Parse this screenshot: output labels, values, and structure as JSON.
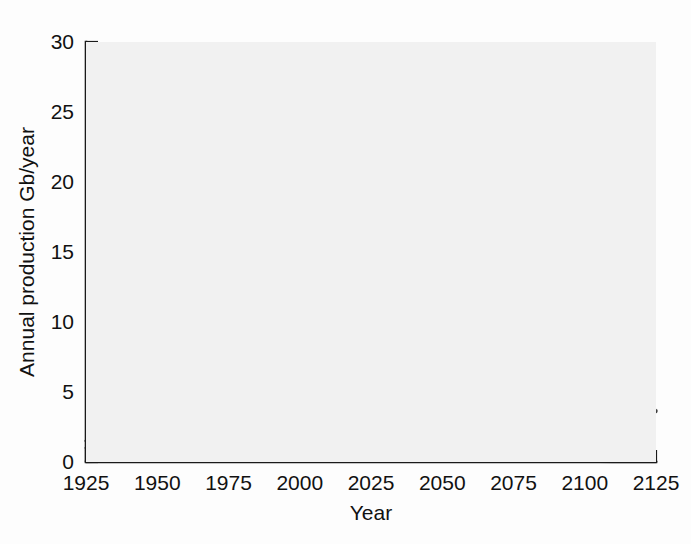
{
  "chart_data": {
    "type": "line",
    "title": "",
    "xlabel": "Year",
    "ylabel": "Annual production Gb/year",
    "xlim": [
      1925,
      2125
    ],
    "ylim": [
      0,
      30
    ],
    "xticks": [
      1925,
      1950,
      1975,
      2000,
      2025,
      2050,
      2075,
      2100,
      2125
    ],
    "yticks": [
      0,
      5,
      10,
      15,
      20,
      25,
      30
    ],
    "grid": false,
    "legend_position": "top-right",
    "units": "Gb/year",
    "x": [
      1925,
      1930,
      1935,
      1940,
      1945,
      1950,
      1955,
      1960,
      1965,
      1970,
      1973,
      1975,
      1979,
      1981,
      1983,
      1985,
      1990,
      1995,
      2000,
      2005,
      2007,
      2010,
      2015,
      2020,
      2025,
      2030,
      2035,
      2040,
      2045,
      2050,
      2055,
      2060,
      2065,
      2070,
      2075,
      2080,
      2085,
      2090,
      2095,
      2100,
      2105,
      2110,
      2115,
      2120,
      2125
    ],
    "series": [
      {
        "name": "Past production",
        "label": "Past production",
        "color": "#3c3c3c",
        "width": 3.1,
        "values": [
          1.5,
          1.9,
          2.2,
          2.8,
          3.2,
          4.0,
          5.2,
          7.2,
          10.2,
          16.8,
          20.3,
          21.6,
          22.8,
          21.0,
          20.2,
          20.4,
          22.3,
          23.6,
          25.6,
          28.2,
          28.7,
          28.4,
          26.6,
          23.1,
          19.0,
          15.3,
          12.5,
          10.4,
          8.9,
          7.8,
          7.0,
          6.4,
          6.0,
          5.7,
          5.5,
          5.3,
          5.1,
          4.9,
          4.7,
          4.5,
          4.3,
          4.1,
          3.9,
          3.75,
          3.6
        ]
      },
      {
        "name": "Conventional",
        "label": "Conventional",
        "color": "#c9c9c9",
        "width": 2.9,
        "values": [
          0.9,
          1.1,
          1.4,
          1.8,
          2.3,
          3.0,
          4.0,
          5.4,
          7.4,
          10.0,
          11.4,
          12.4,
          14.4,
          15.4,
          16.3,
          17.2,
          19.3,
          20.9,
          22.3,
          23.4,
          23.5,
          23.3,
          22.2,
          20.1,
          17.3,
          14.2,
          11.2,
          8.6,
          6.4,
          4.7,
          3.4,
          2.4,
          1.7,
          1.2,
          0.85,
          0.6,
          0.42,
          0.3,
          0.22,
          0.16,
          0.12,
          0.09,
          0.07,
          0.05,
          0.04
        ]
      },
      {
        "name": "Nonconventional",
        "label": "Nonconventional",
        "color": "#b4b4b4",
        "width": 2.9,
        "values": [
          0.02,
          0.03,
          0.04,
          0.05,
          0.07,
          0.1,
          0.14,
          0.2,
          0.28,
          0.4,
          0.46,
          0.52,
          0.65,
          0.72,
          0.8,
          0.88,
          1.1,
          1.35,
          1.65,
          2.0,
          2.15,
          2.35,
          2.8,
          3.25,
          3.7,
          4.1,
          4.5,
          4.85,
          5.1,
          5.35,
          5.5,
          5.65,
          5.75,
          5.82,
          5.87,
          5.9,
          5.88,
          5.8,
          5.65,
          5.45,
          5.15,
          4.8,
          4.4,
          4.0,
          3.65
        ]
      },
      {
        "name": "Gas liquids",
        "label": "Gas liquids",
        "color": "#9a9a9a",
        "width": 2.9,
        "values": [
          0.05,
          0.07,
          0.1,
          0.14,
          0.2,
          0.28,
          0.4,
          0.55,
          0.75,
          1.0,
          1.12,
          1.2,
          1.4,
          1.5,
          1.6,
          1.7,
          1.95,
          2.2,
          2.5,
          2.85,
          3.0,
          3.2,
          3.6,
          3.85,
          3.9,
          3.7,
          3.3,
          2.8,
          2.3,
          1.8,
          1.35,
          1.0,
          0.72,
          0.5,
          0.35,
          0.24,
          0.16,
          0.11,
          0.07,
          0.05,
          0.03,
          0.02,
          0.015,
          0.01,
          0.01
        ]
      },
      {
        "name": "Conventional and nonconventional",
        "label": "Conventional and nonconventional",
        "color": "#5a5a5a",
        "width": 3.1,
        "values": [
          1.0,
          1.25,
          1.55,
          1.95,
          2.45,
          3.1,
          4.1,
          5.6,
          7.7,
          10.4,
          11.9,
          12.9,
          15.05,
          16.1,
          17.1,
          18.05,
          20.4,
          22.25,
          23.95,
          25.4,
          25.65,
          25.65,
          25.0,
          23.35,
          21.0,
          18.3,
          15.7,
          13.45,
          11.5,
          10.05,
          8.9,
          8.05,
          7.45,
          7.02,
          6.72,
          6.5,
          6.3,
          6.1,
          5.87,
          5.61,
          5.27,
          4.89,
          4.47,
          4.05,
          3.69
        ]
      }
    ],
    "legend": [
      {
        "label": "Past production",
        "color": "#3c3c3c",
        "width": 3.4
      },
      {
        "label": "Conventional",
        "color": "#c9c9c9",
        "width": 2.8
      },
      {
        "label": "Nonconventional",
        "color": "#b4b4b4",
        "width": 2.8
      },
      {
        "label": "Gas liquids",
        "color": "#9a9a9a",
        "width": 2.8
      },
      {
        "label": "Conventional and",
        "label2": "nonconventional",
        "color": "#5a5a5a",
        "width": 3.4
      }
    ]
  }
}
